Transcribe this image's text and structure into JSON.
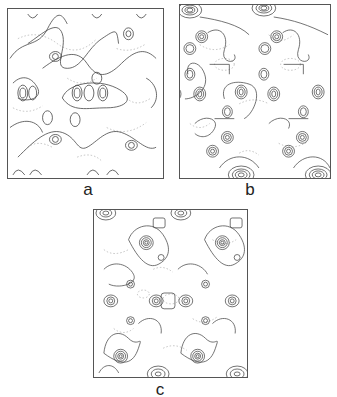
{
  "figure": {
    "panels": [
      {
        "id": "a",
        "label": "a",
        "description": "contour map with diagonal chains of peaks"
      },
      {
        "id": "b",
        "label": "b",
        "description": "contour map with isolated concentric peaks and dense peaks at top/bottom edges"
      },
      {
        "id": "c",
        "label": "c",
        "description": "contour map with concentric peaks and dense peaks at top/bottom edges"
      }
    ]
  },
  "colors": {
    "contour_solid": "#444444",
    "contour_dashed": "#9a9a9a",
    "frame": "#555555",
    "background": "#ffffff"
  }
}
